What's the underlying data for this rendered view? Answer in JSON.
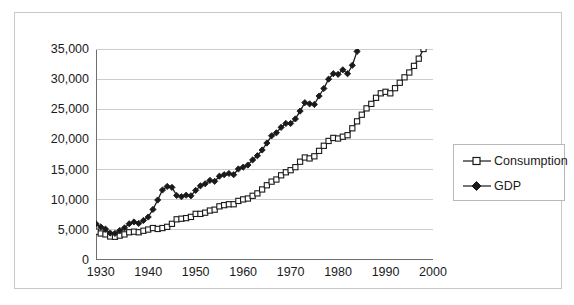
{
  "chart_data": {
    "type": "line",
    "title": "",
    "subtitle": "",
    "xlabel": "",
    "ylabel": "",
    "xlim": [
      1929,
      2000
    ],
    "ylim": [
      0,
      35000
    ],
    "grid": true,
    "grid_axis": "y",
    "legend_position": "right-outside",
    "y_ticks": [
      35000,
      30000,
      25000,
      20000,
      15000,
      10000,
      5000,
      0
    ],
    "y_tick_labels": [
      "35,000",
      "30,000",
      "25,000",
      "20,000",
      "15,000",
      "10,000",
      "5,000",
      "0"
    ],
    "x_ticks": [
      1930,
      1940,
      1950,
      1960,
      1970,
      1980,
      1990,
      2000
    ],
    "x_tick_labels": [
      "1930",
      "1940",
      "1950",
      "1960",
      "1970",
      "1980",
      "1990",
      "2000"
    ],
    "x": [
      1929,
      1930,
      1931,
      1932,
      1933,
      1934,
      1935,
      1936,
      1937,
      1938,
      1939,
      1940,
      1941,
      1942,
      1943,
      1944,
      1945,
      1946,
      1947,
      1948,
      1949,
      1950,
      1951,
      1952,
      1953,
      1954,
      1955,
      1956,
      1957,
      1958,
      1959,
      1960,
      1961,
      1962,
      1963,
      1964,
      1965,
      1966,
      1967,
      1968,
      1969,
      1970,
      1971,
      1972,
      1973,
      1974,
      1975,
      1976,
      1977,
      1978,
      1979,
      1980,
      1981,
      1982,
      1983,
      1984,
      1985,
      1986,
      1987,
      1988,
      1989,
      1990,
      1991,
      1992,
      1993,
      1994,
      1995,
      1996,
      1997,
      1998,
      1999,
      2000
    ],
    "series": [
      {
        "name": "GDP",
        "marker": "filled-diamond",
        "color": "#1a1a1a",
        "values": [
          6000,
          5500,
          5150,
          4480,
          4420,
          4900,
          5330,
          6020,
          6320,
          6080,
          6570,
          7140,
          8400,
          9960,
          11620,
          12540,
          12380,
          10980,
          10870,
          11320,
          11280,
          12270,
          13240,
          13740,
          14380,
          14290,
          15290,
          15610,
          15930,
          15790,
          16890,
          17300,
          17730,
          18800,
          19610,
          20740,
          22060,
          23490,
          24110,
          25250,
          26030,
          26080,
          26940,
          28370,
          30010,
          29870,
          29810,
          31430,
          32880,
          34710,
          35810,
          35720,
          36620,
          35940,
          37570,
          40310,
          41990,
          43420,
          44840,
          46720,
          48380,
          49290,
          49210,
          50890,
          52320,
          54440,
          55780,
          57860,
          60480,
          63090,
          65960,
          68160
        ],
        "values_scaled_note": "displayed in billions of chained dollars; plotted values equal listed value divided by 2 for 1929 onward? no — see values_plot",
        "values_plot": [
          6000,
          5480,
          5130,
          4470,
          4410,
          4890,
          5320,
          6010,
          6310,
          6070,
          6560,
          7130,
          8390,
          9950,
          11610,
          12200,
          12050,
          10700,
          10500,
          10750,
          10650,
          11550,
          12300,
          12650,
          13200,
          13050,
          13900,
          14150,
          14350,
          14150,
          15100,
          15400,
          15750,
          16600,
          17300,
          18250,
          19400,
          20600,
          21100,
          22000,
          22650,
          22650,
          23400,
          24700,
          26100,
          25900,
          25800,
          27200,
          28450,
          30000,
          30900,
          30800,
          31550,
          30900,
          32300,
          34600,
          36000,
          37200,
          38400,
          40000,
          41400,
          42100,
          42000,
          43400,
          44600,
          46400,
          47500,
          49300,
          51500,
          53700,
          56200,
          58100
        ]
      },
      {
        "name": "Consumption",
        "marker": "open-square",
        "color": "#1a1a1a",
        "values_plot": [
          4700,
          4400,
          4250,
          3900,
          3850,
          4050,
          4250,
          4600,
          4700,
          4600,
          4850,
          5050,
          5300,
          5150,
          5300,
          5500,
          6000,
          6750,
          6850,
          6950,
          7150,
          7650,
          7650,
          7850,
          8200,
          8350,
          8900,
          9100,
          9250,
          9250,
          9800,
          10050,
          10200,
          10650,
          11050,
          11700,
          12400,
          13000,
          13350,
          14050,
          14550,
          14900,
          15400,
          16300,
          17000,
          16850,
          17200,
          18100,
          18950,
          19750,
          20250,
          20150,
          20450,
          20700,
          21850,
          23000,
          24100,
          25150,
          25900,
          26900,
          27650,
          27900,
          27650,
          28500,
          29400,
          30300,
          31100,
          32200,
          33400,
          35000,
          36800,
          38200
        ]
      }
    ]
  },
  "legend": {
    "items": [
      {
        "label": "Consumption",
        "marker": "open-square"
      },
      {
        "label": "GDP",
        "marker": "filled-diamond"
      }
    ]
  },
  "axes": {
    "y_axis_name": "value-axis",
    "x_axis_name": "year-axis"
  },
  "colors": {
    "axis": "#6e6e6e",
    "grid": "#cccccc",
    "series": "#1a1a1a",
    "frame": "#c9c9c9",
    "text": "#1a1a1a",
    "background": "#ffffff"
  }
}
